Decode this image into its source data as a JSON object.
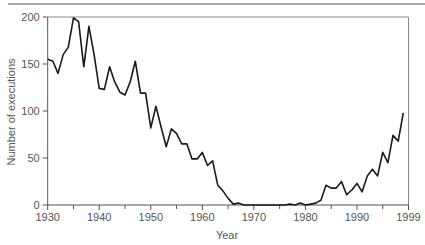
{
  "chart_data": {
    "type": "line",
    "title": "",
    "xlabel": "Year",
    "ylabel": "Number of executions",
    "xlim": [
      1930,
      2000
    ],
    "ylim": [
      0,
      200
    ],
    "x_ticks": [
      1930,
      1940,
      1950,
      1960,
      1970,
      1980,
      1990,
      2000
    ],
    "x_tick_labels": [
      "1930",
      "1940",
      "1950",
      "1960",
      "1970",
      "1980",
      "1990",
      "1999"
    ],
    "x_minor_ticks": [
      1935,
      1945,
      1955,
      1965,
      1975,
      1985,
      1995
    ],
    "y_ticks": [
      0,
      50,
      100,
      150,
      200
    ],
    "y_tick_labels": [
      "0",
      "50",
      "100",
      "150",
      "200"
    ],
    "grid": false,
    "legend": null,
    "line_color": "#1a1a1a",
    "x": [
      1930,
      1931,
      1932,
      1933,
      1934,
      1935,
      1936,
      1937,
      1938,
      1939,
      1940,
      1941,
      1942,
      1943,
      1944,
      1945,
      1946,
      1947,
      1948,
      1949,
      1950,
      1951,
      1952,
      1953,
      1954,
      1955,
      1956,
      1957,
      1958,
      1959,
      1960,
      1961,
      1962,
      1963,
      1964,
      1965,
      1966,
      1967,
      1968,
      1969,
      1970,
      1971,
      1972,
      1973,
      1974,
      1975,
      1976,
      1977,
      1978,
      1979,
      1980,
      1981,
      1982,
      1983,
      1984,
      1985,
      1986,
      1987,
      1988,
      1989,
      1990,
      1991,
      1992,
      1993,
      1994,
      1995,
      1996,
      1997,
      1998,
      1999
    ],
    "series": [
      {
        "name": "Executions",
        "values": [
          155,
          153,
          140,
          160,
          168,
          199,
          195,
          147,
          190,
          160,
          124,
          123,
          147,
          131,
          120,
          117,
          131,
          153,
          119,
          119,
          82,
          105,
          83,
          62,
          81,
          76,
          65,
          65,
          49,
          49,
          56,
          42,
          47,
          21,
          15,
          7,
          1,
          2,
          0,
          0,
          0,
          0,
          0,
          0,
          0,
          0,
          0,
          1,
          0,
          2,
          0,
          1,
          2,
          5,
          21,
          18,
          18,
          25,
          11,
          16,
          23,
          14,
          31,
          38,
          31,
          56,
          45,
          74,
          68,
          98
        ]
      }
    ]
  }
}
